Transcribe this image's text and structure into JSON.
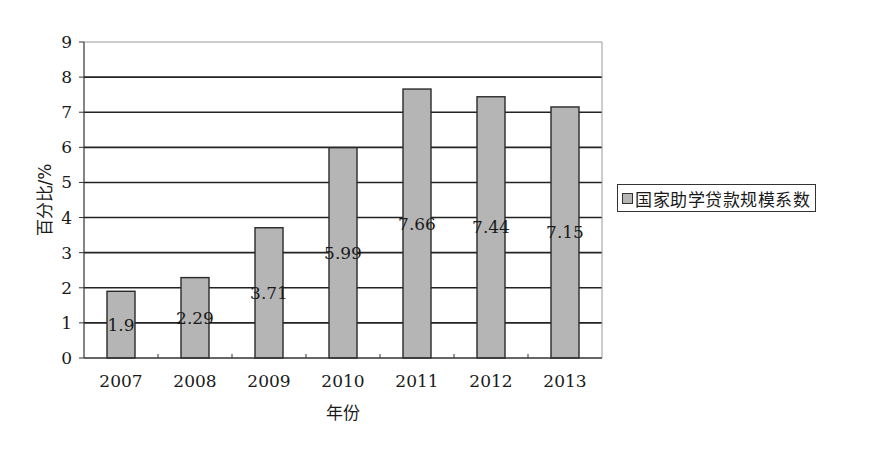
{
  "chart_data": {
    "type": "bar",
    "title": "",
    "xlabel": "年份",
    "ylabel": "百分比/%",
    "categories": [
      "2007",
      "2008",
      "2009",
      "2010",
      "2011",
      "2012",
      "2013"
    ],
    "series": [
      {
        "name": "国家助学贷款规模系数",
        "values": [
          1.9,
          2.29,
          3.71,
          5.99,
          7.66,
          7.44,
          7.15
        ],
        "data_labels": [
          "1.9",
          "2.29",
          "3.71",
          "5.99",
          "7.66",
          "7.44",
          "7.15"
        ],
        "color": "#b5b5b5"
      }
    ],
    "ylim": [
      0,
      9
    ],
    "yticks": [
      "0",
      "1",
      "2",
      "3",
      "4",
      "5",
      "6",
      "7",
      "8",
      "9"
    ],
    "grid": true,
    "legend_position": "right"
  },
  "colors": {
    "bar_fill": "#b5b5b5",
    "bar_stroke": "#2a2a2a",
    "grid": "#222222",
    "axis": "#333333",
    "text": "#1a1a1a"
  }
}
